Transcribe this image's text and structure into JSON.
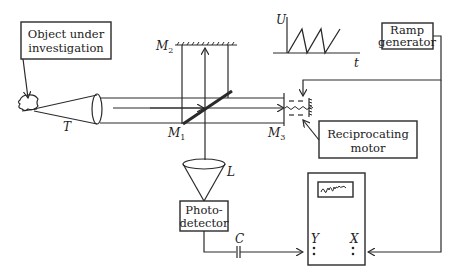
{
  "diagram": {
    "boxes": {
      "object": {
        "line1": "Object under",
        "line2": "investigation"
      },
      "ramp": {
        "line1": "Ramp",
        "line2": "generator"
      },
      "motor": {
        "line1": "Reciprocating",
        "line2": "motor"
      },
      "detector": {
        "line1": "Photo-",
        "line2": "detector"
      }
    },
    "labels": {
      "T": "T",
      "M1": "M",
      "M1_sub": "1",
      "M2": "M",
      "M2_sub": "2",
      "M3": "M",
      "M3_sub": "3",
      "L": "L",
      "C": "C",
      "U": "U",
      "t": "t",
      "Y": "Y",
      "X": "X"
    },
    "inset_plot": {
      "type": "sawtooth",
      "y_axis": "U",
      "x_axis": "t",
      "teeth": 3
    },
    "components": [
      "object-under-investigation",
      "telescope-T",
      "beam-splitter-M1",
      "fixed-mirror-M2",
      "moving-mirror-M3",
      "reciprocating-motor",
      "ramp-generator",
      "lens-L",
      "photodetector",
      "capacitor-C",
      "oscilloscope"
    ]
  }
}
